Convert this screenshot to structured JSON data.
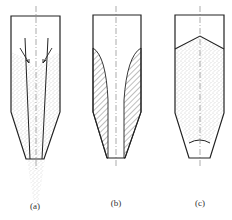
{
  "figure": {
    "panels": [
      {
        "id": "a",
        "label": "(a)",
        "description": "Funnel flow with central channel and surface arrows"
      },
      {
        "id": "b",
        "label": "(b)",
        "description": "Stagnant zones (hatched) along walls"
      },
      {
        "id": "c",
        "label": "(c)",
        "description": "Mass flow filled bin with peaked surface"
      }
    ]
  },
  "colors": {
    "line": "#222222",
    "stipple": "#888888",
    "hatch": "#444444",
    "background": "#ffffff"
  }
}
